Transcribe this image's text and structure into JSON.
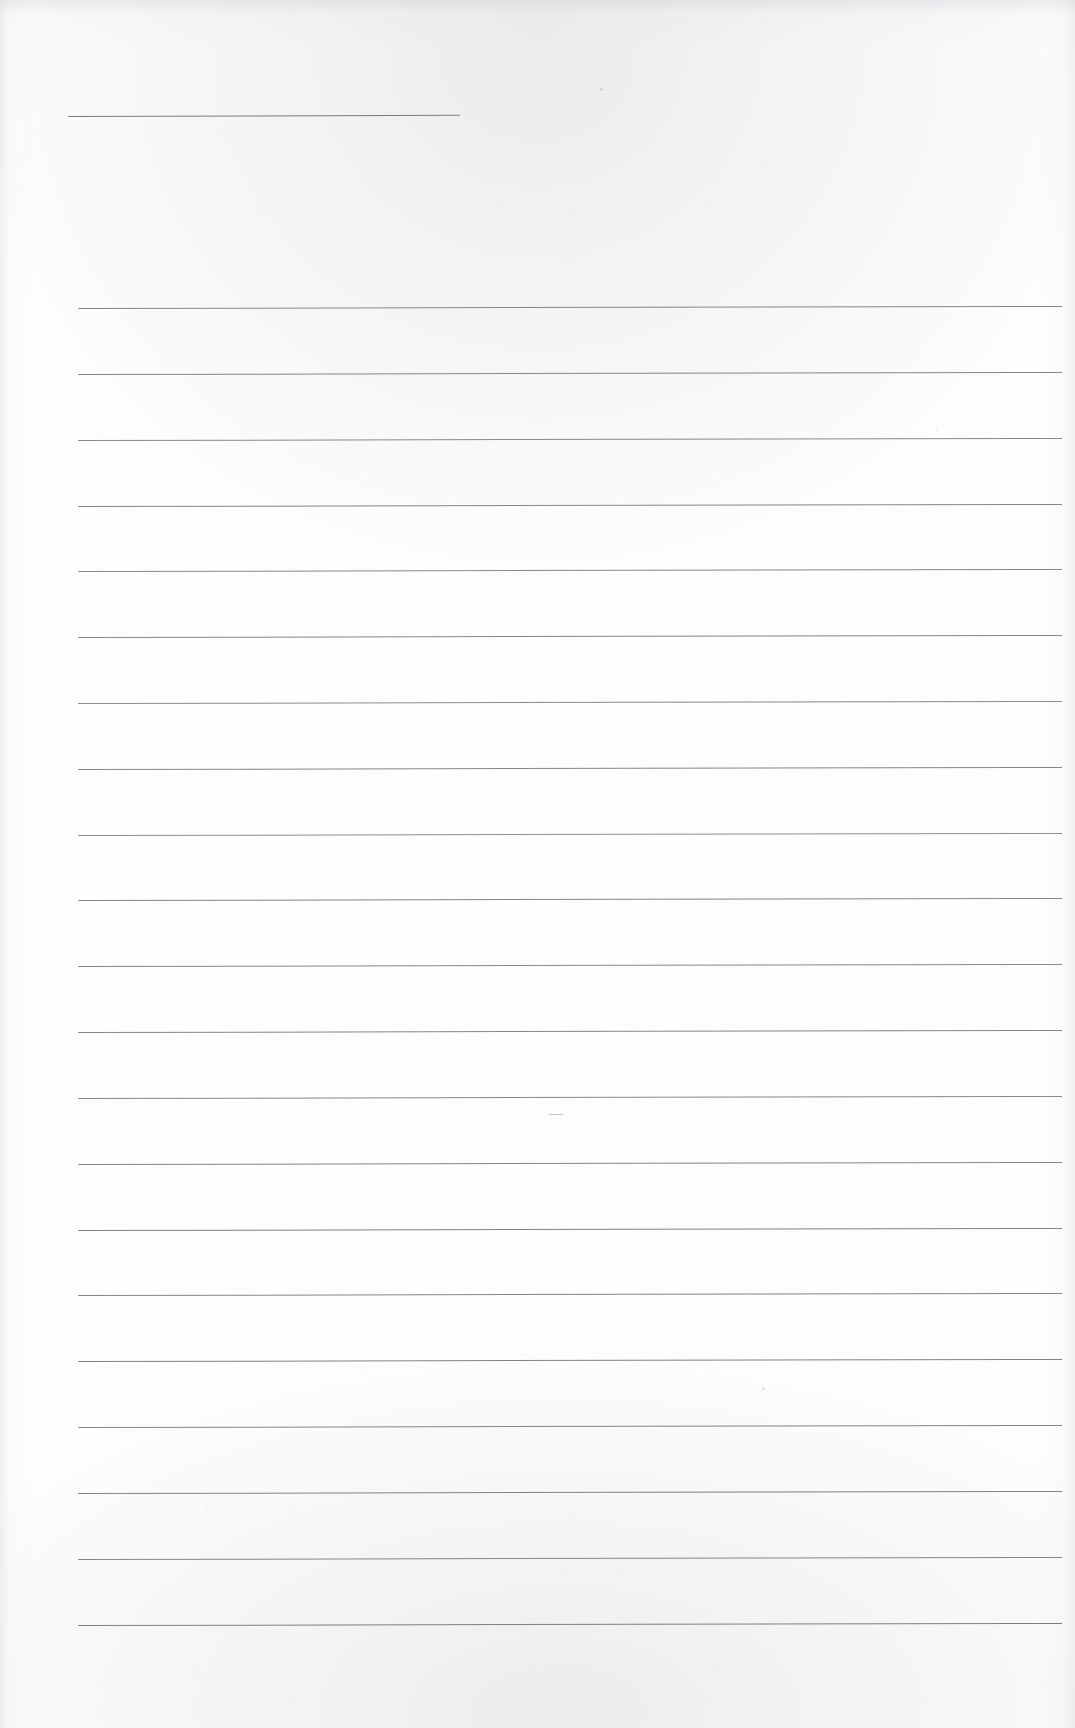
{
  "document": {
    "kind": "scanned-blank-ruled-page",
    "title": "",
    "visible_text": "",
    "note": "Blank scanned ruled form page: no printed or handwritten text is visible."
  },
  "page": {
    "width": 1075,
    "height": 1728,
    "background_color": "#fdfdfd",
    "paper_tone": "#fdfdfd",
    "edge_shadow_color": "#9a9aa2"
  },
  "rules": {
    "ink_color": "#8a8a90",
    "ink_color_strong": "#76767d",
    "left_x": 78,
    "right_x": 1062,
    "first_y": 308,
    "spacing": 65.85,
    "count": 21,
    "skew_degrees": -0.12,
    "lines": [
      {
        "index": 1,
        "y": 308,
        "x1": 78,
        "x2": 1062,
        "color": "#85858b",
        "thickness": 1
      },
      {
        "index": 2,
        "y": 374,
        "x1": 78,
        "x2": 1062,
        "color": "#85858b",
        "thickness": 1
      },
      {
        "index": 3,
        "y": 440,
        "x1": 78,
        "x2": 1062,
        "color": "#88888e",
        "thickness": 1
      },
      {
        "index": 4,
        "y": 506,
        "x1": 78,
        "x2": 1062,
        "color": "#85858b",
        "thickness": 1
      },
      {
        "index": 5,
        "y": 571,
        "x1": 78,
        "x2": 1062,
        "color": "#88888e",
        "thickness": 1
      },
      {
        "index": 6,
        "y": 637,
        "x1": 78,
        "x2": 1062,
        "color": "#85858b",
        "thickness": 1
      },
      {
        "index": 7,
        "y": 703,
        "x1": 78,
        "x2": 1062,
        "color": "#8a8a90",
        "thickness": 1
      },
      {
        "index": 8,
        "y": 769,
        "x1": 78,
        "x2": 1062,
        "color": "#85858b",
        "thickness": 1
      },
      {
        "index": 9,
        "y": 835,
        "x1": 78,
        "x2": 1062,
        "color": "#8c8c92",
        "thickness": 1
      },
      {
        "index": 10,
        "y": 900,
        "x1": 78,
        "x2": 1062,
        "color": "#85858b",
        "thickness": 1
      },
      {
        "index": 11,
        "y": 966,
        "x1": 78,
        "x2": 1062,
        "color": "#88888e",
        "thickness": 1
      },
      {
        "index": 12,
        "y": 1032,
        "x1": 78,
        "x2": 1062,
        "color": "#85858b",
        "thickness": 1
      },
      {
        "index": 13,
        "y": 1098,
        "x1": 78,
        "x2": 1062,
        "color": "#88888e",
        "thickness": 1
      },
      {
        "index": 14,
        "y": 1164,
        "x1": 78,
        "x2": 1062,
        "color": "#85858b",
        "thickness": 1
      },
      {
        "index": 15,
        "y": 1230,
        "x1": 78,
        "x2": 1062,
        "color": "#828288",
        "thickness": 1
      },
      {
        "index": 16,
        "y": 1295,
        "x1": 78,
        "x2": 1062,
        "color": "#85858b",
        "thickness": 1
      },
      {
        "index": 17,
        "y": 1361,
        "x1": 78,
        "x2": 1062,
        "color": "#828288",
        "thickness": 1
      },
      {
        "index": 18,
        "y": 1427,
        "x1": 78,
        "x2": 1062,
        "color": "#85858b",
        "thickness": 1
      },
      {
        "index": 19,
        "y": 1493,
        "x1": 78,
        "x2": 1062,
        "color": "#828288",
        "thickness": 1
      },
      {
        "index": 20,
        "y": 1559,
        "x1": 78,
        "x2": 1062,
        "color": "#85858b",
        "thickness": 1
      },
      {
        "index": 21,
        "y": 1625,
        "x1": 78,
        "x2": 1062,
        "color": "#7e7e85",
        "thickness": 1
      }
    ]
  },
  "header_rule": {
    "label": "short-blank-line",
    "y": 116,
    "x1": 68,
    "x2": 460,
    "color": "#7b7b82",
    "thickness": 1,
    "skew_degrees": -0.18
  },
  "artifacts": {
    "specks": [
      {
        "x": 600,
        "y": 88,
        "size": 3,
        "color": "rgba(140,140,150,0.30)"
      },
      {
        "x": 347,
        "y": 231,
        "size": 2,
        "color": "rgba(150,150,160,0.22)"
      },
      {
        "x": 567,
        "y": 256,
        "size": 2,
        "color": "rgba(150,150,160,0.20)"
      },
      {
        "x": 936,
        "y": 429,
        "size": 2,
        "color": "rgba(150,150,160,0.20)"
      },
      {
        "x": 742,
        "y": 911,
        "size": 2,
        "color": "rgba(150,150,160,0.18)"
      },
      {
        "x": 762,
        "y": 1387,
        "size": 3,
        "color": "rgba(140,140,150,0.26)"
      },
      {
        "x": 205,
        "y": 1509,
        "size": 2,
        "color": "rgba(150,150,160,0.18)"
      }
    ],
    "dashes": [
      {
        "x": 549,
        "y": 1114,
        "width": 14,
        "color": "rgba(120,120,130,0.45)"
      }
    ]
  }
}
